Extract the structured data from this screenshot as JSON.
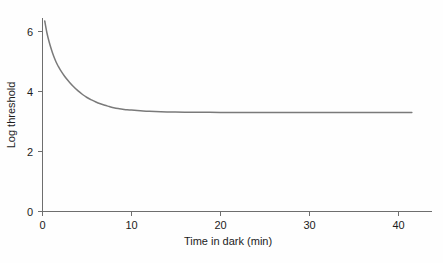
{
  "chart_data": {
    "type": "line",
    "title": "",
    "subtitle": "",
    "xlabel": "Time in dark (min)",
    "ylabel": "Log threshold",
    "xlim": [
      0,
      44
    ],
    "ylim": [
      0,
      7
    ],
    "xticks": [
      0,
      10,
      20,
      30,
      40
    ],
    "xtick_labels": [
      "0",
      "10",
      "20",
      "30",
      "40"
    ],
    "yticks": [
      0,
      2,
      4,
      6
    ],
    "ytick_labels": [
      "0",
      "2",
      "4",
      "6"
    ],
    "grid": false,
    "legend": null,
    "annotations": [],
    "series": [
      {
        "name": "dark adaptation curve",
        "color": "#7a7a7a",
        "asymptote": 3.3,
        "x": [
          0.25,
          0.5,
          0.75,
          1.0,
          1.25,
          1.5,
          1.75,
          2.0,
          2.5,
          3.0,
          3.5,
          4.0,
          4.5,
          5.0,
          5.5,
          6.0,
          6.5,
          7.0,
          7.5,
          8.0,
          8.5,
          9.0,
          9.5,
          10.0,
          11.0,
          12.0,
          14.0,
          16.0,
          18.0,
          20.0,
          24.0,
          28.0,
          32.0,
          36.0,
          40.0,
          41.5
        ],
        "y": [
          6.35,
          5.95,
          5.65,
          5.4,
          5.18,
          5.0,
          4.85,
          4.72,
          4.5,
          4.32,
          4.16,
          4.02,
          3.9,
          3.8,
          3.72,
          3.65,
          3.59,
          3.54,
          3.5,
          3.46,
          3.43,
          3.41,
          3.39,
          3.38,
          3.36,
          3.34,
          3.32,
          3.31,
          3.31,
          3.3,
          3.3,
          3.3,
          3.3,
          3.3,
          3.3,
          3.3
        ]
      }
    ]
  },
  "axes": {
    "y_title": "Log threshold",
    "x_title": "Time in dark (min)"
  },
  "colors": {
    "curve": "#7a7a7a",
    "axis": "#6e6e6e",
    "text": "#1c1c1c",
    "background": "#fefefe"
  }
}
